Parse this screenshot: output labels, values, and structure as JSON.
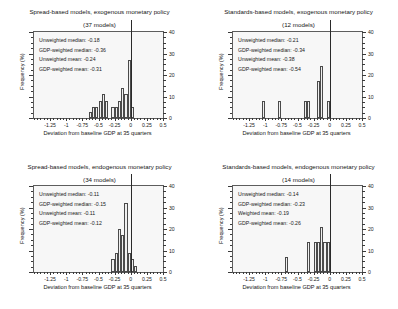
{
  "figure": {
    "panel_count": 4,
    "xlabel": "Deviation from baseline GDP at 35 quarters",
    "ylabel": "Frequency (%)",
    "xticks": [
      "-1.25",
      "-1",
      "-0.75",
      "-0.5",
      "-0.25",
      "0",
      "0.25",
      "0.5"
    ],
    "yticks": [
      "0",
      "10",
      "20",
      "30",
      "40"
    ]
  },
  "chart_data": [
    {
      "type": "bar",
      "title": "Spread-based models, exogenous monetary policy",
      "subtitle": "(37 models)",
      "xlabel": "Deviation from baseline GDP at 35 quarters",
      "ylabel": "Frequency (%)",
      "xlim": [
        -1.5,
        0.5
      ],
      "ylim": [
        0,
        40
      ],
      "xticks": [
        -1.25,
        -1,
        -0.75,
        -0.5,
        -0.25,
        0,
        0.25,
        0.5
      ],
      "yticks": [
        0,
        10,
        20,
        30,
        40
      ],
      "grid": false,
      "legend": "none",
      "bin_width": 0.05,
      "bin_left_edges": [
        -0.75,
        -0.7,
        -0.65,
        -0.6,
        -0.55,
        -0.5,
        -0.45,
        -0.4,
        -0.35,
        -0.3,
        -0.25,
        -0.2,
        -0.15,
        -0.1,
        -0.05
      ],
      "values": [
        0,
        0,
        3,
        5,
        5,
        8,
        11,
        8,
        0,
        5,
        5,
        8,
        14,
        11,
        27,
        5
      ],
      "categories": [
        "-0.65",
        "-0.60",
        "-0.55",
        "-0.50",
        "-0.45",
        "-0.40",
        "-0.35",
        "-0.30",
        "-0.25",
        "-0.20",
        "-0.15",
        "-0.10",
        "-0.05",
        "0"
      ],
      "series": [
        {
          "name": "Frequency (%)",
          "bars": [
            {
              "x": -0.65,
              "height": 3
            },
            {
              "x": -0.6,
              "height": 5
            },
            {
              "x": -0.55,
              "height": 5
            },
            {
              "x": -0.5,
              "height": 8
            },
            {
              "x": -0.45,
              "height": 11
            },
            {
              "x": -0.4,
              "height": 8
            },
            {
              "x": -0.3,
              "height": 5
            },
            {
              "x": -0.25,
              "height": 5
            },
            {
              "x": -0.2,
              "height": 8
            },
            {
              "x": -0.15,
              "height": 14
            },
            {
              "x": -0.1,
              "height": 11
            },
            {
              "x": -0.05,
              "height": 27
            },
            {
              "x": 0.0,
              "height": 5
            }
          ]
        }
      ],
      "vertical_marker": 0.0,
      "annotations": [
        "Unweighted median: -0.18",
        "GDP-weighted median: -0.36",
        "Unweighted mean: -0.24",
        "GDP-weighted mean: -0.31"
      ],
      "stats": {
        "unweighted_median": -0.18,
        "gdp_weighted_median": -0.36,
        "unweighted_mean": -0.24,
        "gdp_weighted_mean": -0.31,
        "n_models": 37
      }
    },
    {
      "type": "bar",
      "title": "Standards-based models, exogenous monetary policy",
      "subtitle": "(12 models)",
      "xlabel": "Deviation from baseline GDP at 35 quarters",
      "ylabel": "Frequency (%)",
      "xlim": [
        -1.5,
        0.5
      ],
      "ylim": [
        0,
        40
      ],
      "xticks": [
        -1.25,
        -1,
        -0.75,
        -0.5,
        -0.25,
        0,
        0.25,
        0.5
      ],
      "yticks": [
        0,
        10,
        20,
        30,
        40
      ],
      "grid": false,
      "legend": "none",
      "bin_width": 0.05,
      "categories": [
        "-1.05",
        "-0.80",
        "-0.40",
        "-0.35",
        "-0.20",
        "-0.15",
        "-0.05"
      ],
      "values": [
        8,
        8,
        8,
        8,
        17,
        24,
        8
      ],
      "series": [
        {
          "name": "Frequency (%)",
          "bars": [
            {
              "x": -1.05,
              "height": 8
            },
            {
              "x": -0.8,
              "height": 8
            },
            {
              "x": -0.4,
              "height": 8
            },
            {
              "x": -0.35,
              "height": 8
            },
            {
              "x": -0.2,
              "height": 17
            },
            {
              "x": -0.15,
              "height": 24
            },
            {
              "x": -0.05,
              "height": 8
            }
          ]
        }
      ],
      "vertical_marker": 0.0,
      "annotations": [
        "Unweighted median: -0.21",
        "GDP-weighted median: -0.34",
        "Unweighted mean: -0.38",
        "GDP-weighted mean: -0.54"
      ],
      "stats": {
        "unweighted_median": -0.21,
        "gdp_weighted_median": -0.34,
        "unweighted_mean": -0.38,
        "gdp_weighted_mean": -0.54,
        "n_models": 12
      }
    },
    {
      "type": "bar",
      "title": "Spread-based models, endogenous monetary policy",
      "subtitle": "(34 models)",
      "xlabel": "Deviation from baseline GDP at 35 quarters",
      "ylabel": "Frequency (%)",
      "xlim": [
        -1.5,
        0.5
      ],
      "ylim": [
        0,
        40
      ],
      "xticks": [
        -1.25,
        -1,
        -0.75,
        -0.5,
        -0.25,
        0,
        0.25,
        0.5
      ],
      "yticks": [
        0,
        10,
        20,
        30,
        40
      ],
      "grid": false,
      "legend": "none",
      "bin_width": 0.05,
      "categories": [
        "-0.30",
        "-0.25",
        "-0.20",
        "-0.15",
        "-0.10",
        "-0.05",
        "0",
        "0.05"
      ],
      "values": [
        6,
        9,
        20,
        17,
        32,
        9,
        6,
        3
      ],
      "series": [
        {
          "name": "Frequency (%)",
          "bars": [
            {
              "x": -0.3,
              "height": 6
            },
            {
              "x": -0.25,
              "height": 9
            },
            {
              "x": -0.2,
              "height": 20
            },
            {
              "x": -0.15,
              "height": 17
            },
            {
              "x": -0.1,
              "height": 32
            },
            {
              "x": -0.05,
              "height": 9
            },
            {
              "x": 0.0,
              "height": 6
            },
            {
              "x": 0.05,
              "height": 3
            }
          ]
        }
      ],
      "vertical_marker": 0.0,
      "annotations": [
        "Unweighted median: -0.11",
        "GDP-weighted median: -0.15",
        "Unweighted mean: -0.11",
        "GDP-weighted mean: -0.12"
      ],
      "stats": {
        "unweighted_median": -0.11,
        "gdp_weighted_median": -0.15,
        "unweighted_mean": -0.11,
        "gdp_weighted_mean": -0.12,
        "n_models": 34
      }
    },
    {
      "type": "bar",
      "title": "Standards-based models, endogenous monetary policy",
      "subtitle": "(14 models)",
      "xlabel": "Deviation from baseline GDP at 35 quarters",
      "ylabel": "Frequency (%)",
      "xlim": [
        -1.5,
        0.5
      ],
      "ylim": [
        0,
        40
      ],
      "xticks": [
        -1.25,
        -1,
        -0.75,
        -0.5,
        -0.25,
        0,
        0.25,
        0.5
      ],
      "yticks": [
        0,
        10,
        20,
        30,
        40
      ],
      "grid": false,
      "legend": "none",
      "bin_width": 0.05,
      "categories": [
        "-0.70",
        "-0.35",
        "-0.25",
        "-0.20",
        "-0.15",
        "-0.10",
        "-0.05"
      ],
      "values": [
        7,
        14,
        14,
        14,
        21,
        14,
        14
      ],
      "series": [
        {
          "name": "Frequency (%)",
          "bars": [
            {
              "x": -0.7,
              "height": 7
            },
            {
              "x": -0.35,
              "height": 14
            },
            {
              "x": -0.25,
              "height": 14
            },
            {
              "x": -0.2,
              "height": 14
            },
            {
              "x": -0.15,
              "height": 21
            },
            {
              "x": -0.1,
              "height": 14
            },
            {
              "x": -0.05,
              "height": 14
            }
          ]
        }
      ],
      "vertical_marker": 0.0,
      "annotations": [
        "Unweighted median: -0.14",
        "GDP-weighted median: -0.23",
        "Weighted mean: -0.19",
        "GDP-weighted mean: -0.26"
      ],
      "stats": {
        "unweighted_median": -0.14,
        "gdp_weighted_median": -0.23,
        "weighted_mean": -0.19,
        "gdp_weighted_mean": -0.26,
        "n_models": 14
      }
    }
  ]
}
